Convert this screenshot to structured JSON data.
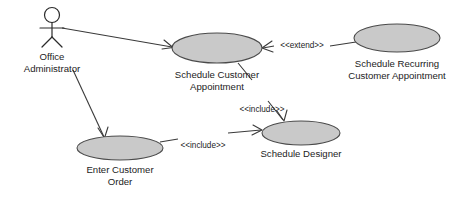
{
  "diagram": {
    "type": "uml-use-case-diagram",
    "background_color": "#ffffff",
    "ellipse_fill": "#c9c9c9",
    "ellipse_stroke": "#4a4a4a",
    "line_color": "#3a3a3a",
    "text_color": "#1c1c1c",
    "actors": [
      {
        "id": "office-administrator",
        "label_line1": "Office",
        "label_line2": "Administrator",
        "head_cx": 52,
        "head_cy": 15,
        "head_r": 7.5,
        "body_top": 22.5,
        "body_bottom": 37,
        "arm_left_x": 40,
        "arm_right_x": 64,
        "arm_y": 28,
        "leg_left_x": 42,
        "leg_right_x": 62,
        "leg_y": 47,
        "label1_x": 52,
        "label1_y": 57,
        "label2_x": 52,
        "label2_y": 69
      }
    ],
    "use_cases": [
      {
        "id": "schedule-customer-appointment",
        "cx": 217,
        "cy": 48,
        "rx": 45,
        "ry": 15,
        "label_line1": "Schedule Customer",
        "label_line2": "Appointment",
        "label1_x": 217,
        "label1_y": 75,
        "label2_x": 217,
        "label2_y": 87
      },
      {
        "id": "schedule-recurring-customer-appointment",
        "cx": 397,
        "cy": 38,
        "rx": 43,
        "ry": 14,
        "label_line1": "Schedule Recurring",
        "label_line2": "Customer Appointment",
        "label1_x": 397,
        "label1_y": 64,
        "label2_x": 397,
        "label2_y": 76
      },
      {
        "id": "schedule-designer",
        "cx": 301,
        "cy": 133,
        "rx": 39,
        "ry": 12,
        "label_line1": "Schedule Designer",
        "label_line2": "",
        "label1_x": 301,
        "label1_y": 154,
        "label2_x": 301,
        "label2_y": 154
      },
      {
        "id": "enter-customer-order",
        "cx": 120,
        "cy": 148,
        "rx": 43,
        "ry": 12,
        "label_line1": "Enter Customer",
        "label_line2": "Order",
        "label1_x": 120,
        "label1_y": 170,
        "label2_x": 120,
        "label2_y": 182
      }
    ],
    "connectors": [
      {
        "id": "administrator-to-schedule-appointment",
        "kind": "association",
        "path": "M 62 28 L 172 47",
        "head": "M 164 40 L 173 47.5 L 162 49",
        "stereotype": "",
        "stereotype_x": 0,
        "stereotype_y": 0
      },
      {
        "id": "administrator-to-enter-customer-order",
        "kind": "association",
        "path": "M 73 70 L 104 137",
        "head": "M 98 128 L 104.5 138 L 108 127",
        "stereotype": "",
        "stereotype_x": 0,
        "stereotype_y": 0
      },
      {
        "id": "schedule-recurring-extend-schedule-appointment",
        "kind": "extend",
        "path": "M 356 42 L 330 46 M 274 46 L 263 48",
        "head": "M 272 41 L 262 48 L 273 52",
        "stereotype": "<<extend>>",
        "stereotype_x": 302,
        "stereotype_y": 46
      },
      {
        "id": "schedule-appointment-include-schedule-designer",
        "kind": "include",
        "path": "M 238 63 L 252 80 M 268 101 L 283 120",
        "head": "M 277 111 L 284 121 L 287 110",
        "stereotype": "<<include>>",
        "stereotype_x": 262,
        "stereotype_y": 110
      },
      {
        "id": "enter-customer-order-include-schedule-designer",
        "kind": "include",
        "path": "M 160 142 L 178 139 M 228 133 L 261 130",
        "head": "M 253 125 L 262 130 L 252 135",
        "stereotype": "<<include>>",
        "stereotype_x": 203,
        "stereotype_y": 146
      }
    ]
  }
}
